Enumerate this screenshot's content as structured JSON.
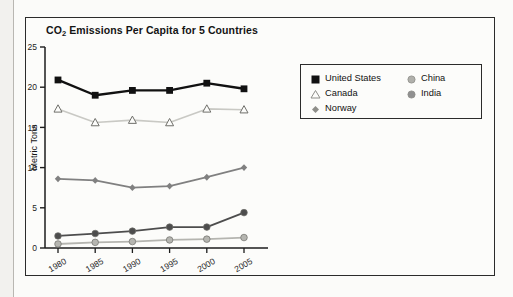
{
  "figure": {
    "title_main": "CO",
    "title_sub": "2",
    "title_rest": " Emissions Per Capita for 5 Countries"
  },
  "chart_data": {
    "type": "line",
    "title": "CO2 Emissions Per Capita for 5 Countries",
    "xlabel": "",
    "ylabel": "Metric Tons",
    "categories": [
      "1980",
      "1985",
      "1990",
      "1995",
      "2000",
      "2005"
    ],
    "x": [
      1980,
      1985,
      1990,
      1995,
      2000,
      2005
    ],
    "xlim": [
      1980,
      2005
    ],
    "ylim": [
      0,
      25
    ],
    "yticks": [
      0,
      5,
      10,
      15,
      20,
      25
    ],
    "grid": false,
    "legend_position": "upper right",
    "series": [
      {
        "name": "United States",
        "values": [
          20.9,
          19.0,
          19.6,
          19.6,
          20.5,
          19.8
        ],
        "color": "#111111",
        "marker": "square-filled",
        "line_width": 2.4
      },
      {
        "name": "Canada",
        "values": [
          17.3,
          15.6,
          15.9,
          15.6,
          17.3,
          17.2
        ],
        "color": "#c9c9c4",
        "marker": "triangle-open",
        "line_width": 1.6
      },
      {
        "name": "Norway",
        "values": [
          8.6,
          8.4,
          7.5,
          7.7,
          8.8,
          10.0
        ],
        "color": "#808080",
        "marker": "diamond-filled",
        "line_width": 1.8
      },
      {
        "name": "China",
        "values": [
          1.5,
          1.8,
          2.1,
          2.6,
          2.6,
          4.4
        ],
        "color": "#4d4d4d",
        "marker": "circle-filled",
        "line_width": 1.8
      },
      {
        "name": "India",
        "values": [
          0.5,
          0.7,
          0.8,
          1.0,
          1.1,
          1.3
        ],
        "color": "#b5b5b0",
        "marker": "circle-filled",
        "line_width": 1.8
      }
    ]
  },
  "legend": {
    "columns": [
      {
        "entries": [
          {
            "label": "United States",
            "marker": "square-filled",
            "color": "#111111"
          },
          {
            "label": "Canada",
            "marker": "triangle-open",
            "color": "#8e8e89"
          },
          {
            "label": "Norway",
            "marker": "diamond-filled",
            "color": "#8e8e89"
          }
        ]
      },
      {
        "entries": [
          {
            "label": "China",
            "marker": "circle-filled",
            "color": "#b0b0ab"
          },
          {
            "label": "India",
            "marker": "circle-filled",
            "color": "#909090"
          }
        ]
      }
    ]
  }
}
